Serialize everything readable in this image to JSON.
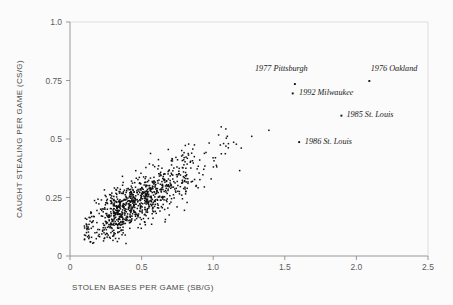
{
  "chart": {
    "type": "scatter",
    "title": "",
    "xlabel": "STOLEN BASES PER GAME (SB/G)",
    "ylabel": "CAUGHT STEALING PER GAME (CS/G)",
    "xlim": [
      0,
      2.5
    ],
    "ylim": [
      0,
      1.0
    ],
    "xticks": [
      "0",
      "0.5",
      "1.0",
      "1.5",
      "2.0",
      "2.5"
    ],
    "xtick_values": [
      0,
      0.5,
      1.0,
      1.5,
      2.0,
      2.5
    ],
    "yticks": [
      "0",
      "0.25",
      "0.5",
      "0.75",
      "1.0"
    ],
    "ytick_values": [
      0,
      0.25,
      0.5,
      0.75,
      1.0
    ],
    "grid": false,
    "legend": "none",
    "marker_color": "#101010",
    "axis_color": "#8d8d8d"
  },
  "annotations": [
    {
      "label": "1977 Pittsburgh",
      "x": 1.57,
      "y": 0.735,
      "label_x": 1.66,
      "label_y": 0.79,
      "anchor": "end"
    },
    {
      "label": "1976 Oakland",
      "x": 2.09,
      "y": 0.748,
      "label_x": 2.1,
      "label_y": 0.79,
      "anchor": "start"
    },
    {
      "label": "1992 Milwaukee",
      "x": 1.555,
      "y": 0.695,
      "label_x": 1.6,
      "label_y": 0.688,
      "anchor": "start"
    },
    {
      "label": "1985 St. Louis",
      "x": 1.895,
      "y": 0.6,
      "label_x": 1.93,
      "label_y": 0.593,
      "anchor": "start"
    },
    {
      "label": "1986 St. Louis",
      "x": 1.6,
      "y": 0.487,
      "label_x": 1.64,
      "label_y": 0.48,
      "anchor": "start"
    }
  ],
  "chart_data": {
    "type": "scatter",
    "title": "",
    "xlabel": "STOLEN BASES PER GAME (SB/G)",
    "ylabel": "CAUGHT STEALING PER GAME (CS/G)",
    "xlim": [
      0,
      2.5
    ],
    "ylim": [
      0,
      1.0
    ],
    "xticks": [
      0,
      0.5,
      1.0,
      1.5,
      2.0,
      2.5
    ],
    "yticks": [
      0,
      0.25,
      0.5,
      0.75,
      1.0
    ],
    "grid": false,
    "legend": "none",
    "series": [
      {
        "name": "Team seasons",
        "marker": "dot",
        "color": "#101010",
        "highlighted": [
          {
            "name": "1977 Pittsburgh",
            "x": 1.57,
            "y": 0.735
          },
          {
            "name": "1976 Oakland",
            "x": 2.09,
            "y": 0.748
          },
          {
            "name": "1992 Milwaukee",
            "x": 1.555,
            "y": 0.695
          },
          {
            "name": "1985 St. Louis",
            "x": 1.895,
            "y": 0.6
          },
          {
            "name": "1986 St. Louis",
            "x": 1.6,
            "y": 0.487
          }
        ],
        "cloud": {
          "description": "Dense positively-correlated cloud of team-seasons; SB/G from about 0.07 to 1.45, CS/G from about 0.05 to 0.73, densest between SB/G 0.25-0.80 and CS/G 0.18-0.35",
          "n_points": 940,
          "x_range": [
            0.07,
            1.45
          ],
          "y_range": [
            0.05,
            0.73
          ],
          "core_x_range": [
            0.22,
            0.85
          ],
          "core_y_range": [
            0.17,
            0.37
          ],
          "slope": 0.33,
          "intercept": 0.075,
          "scatter_sd": 0.055
        }
      }
    ]
  }
}
